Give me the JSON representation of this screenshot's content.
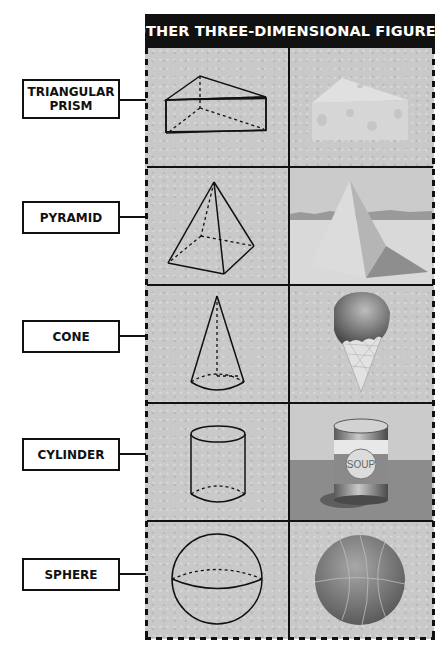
{
  "title": "OTHER THREE-DIMENSIONAL FIGURES",
  "rows": [
    {
      "label_lines": [
        "TRIANGULAR",
        "PRISM"
      ],
      "figure": "triangular-prism",
      "example": "cheese wedge"
    },
    {
      "label_lines": [
        "PYRAMID"
      ],
      "figure": "pyramid",
      "example": "pyramid in desert"
    },
    {
      "label_lines": [
        "CONE"
      ],
      "figure": "cone",
      "example": "ice cream cone"
    },
    {
      "label_lines": [
        "CYLINDER"
      ],
      "figure": "cylinder",
      "example": "soup can"
    },
    {
      "label_lines": [
        "SPHERE"
      ],
      "figure": "sphere",
      "example": "basketball"
    }
  ],
  "soup_can_text": "SOUP",
  "colors": {
    "header_bg": "#111111",
    "cell_bg": "#c9c9c9",
    "line": "#111111"
  }
}
